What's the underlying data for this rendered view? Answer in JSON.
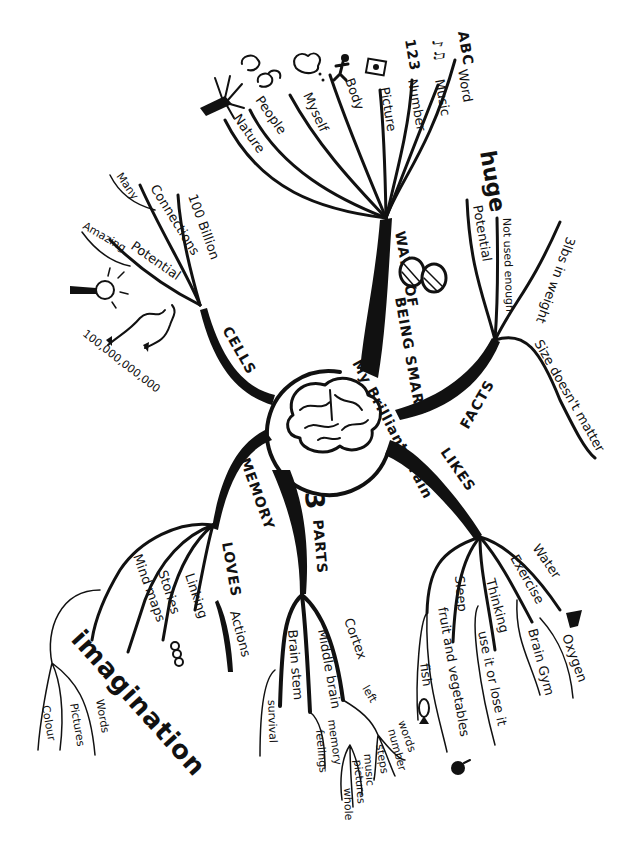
{
  "title": "My Brilliant Brain",
  "colors": {
    "ink": "#111111",
    "paper": "#ffffff"
  },
  "center": {
    "label": "My Brilliant Brain",
    "icon": "brain-icon"
  },
  "branches": {
    "ways": {
      "label": "WAYS OF",
      "label2": "BEING SMART",
      "badge": "8",
      "children": [
        {
          "label": "Word",
          "icon_text": "ABC"
        },
        {
          "label": "Music",
          "icon_text": "♪♫"
        },
        {
          "label": "Number",
          "icon_text": "123"
        },
        {
          "label": "Picture",
          "icon": "picture-icon"
        },
        {
          "label": "Body",
          "icon": "person-icon"
        },
        {
          "label": "Myself",
          "icon": "thought-bubble-icon"
        },
        {
          "label": "People",
          "icon": "faces-icon"
        },
        {
          "label": "Nature",
          "icon": "tree-icon"
        }
      ]
    },
    "facts": {
      "label": "FACTS",
      "children": [
        {
          "label": "Potential",
          "note": "huge"
        },
        {
          "label": "Not used enough"
        },
        {
          "label": "3lbs in weight"
        },
        {
          "label": "Size doesn't matter"
        }
      ]
    },
    "likes": {
      "label": "LIKES",
      "children": [
        {
          "label": "Water"
        },
        {
          "label": "Exercise",
          "sub": "Brain Gym"
        },
        {
          "label": "Oxygen"
        },
        {
          "label": "Thinking",
          "sub": "use it or lose it"
        },
        {
          "label": "Sleep"
        },
        {
          "label": "fruit and vegetables",
          "sub": "fish"
        }
      ]
    },
    "parts": {
      "label": "PARTS",
      "number": "3",
      "children": [
        {
          "label": "Cortex",
          "sub": [
            "left",
            "right"
          ],
          "left": [
            "words",
            "number",
            "steps"
          ],
          "right": [
            "music",
            "pictures",
            "whole"
          ]
        },
        {
          "label": "Middle brain",
          "sub": [
            "memory",
            "feelings"
          ]
        },
        {
          "label": "Brain stem",
          "sub": [
            "survival"
          ]
        }
      ]
    },
    "memory": {
      "label": "MEMORY",
      "label2": "LOVES",
      "children": [
        {
          "label": "Actions"
        },
        {
          "label": "Linking"
        },
        {
          "label": "Stories"
        },
        {
          "label": "Mind maps"
        }
      ],
      "imagination": {
        "label": "imagination",
        "children": [
          "Words",
          "Pictures",
          "Colour"
        ]
      }
    },
    "cells": {
      "label": "CELLS",
      "children": [
        {
          "label": "100 Billion"
        },
        {
          "label": "Connections",
          "sub": "Many"
        },
        {
          "label": "Potential",
          "sub": "Amazing"
        }
      ],
      "count": "100,000,000,000"
    }
  }
}
